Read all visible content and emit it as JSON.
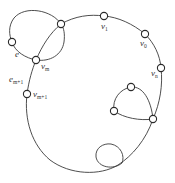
{
  "diagram": {
    "type": "graph",
    "colors": {
      "stroke": "#3a3a3a",
      "node_fill": "#ffffff",
      "background": "#ffffff"
    },
    "labels": {
      "e": {
        "base": "e",
        "sub": ""
      },
      "vm": {
        "base": "v",
        "sub": "m"
      },
      "em1": {
        "base": "e",
        "sub": "m+1"
      },
      "vm1": {
        "base": "v",
        "sub": "m+1"
      },
      "v1": {
        "base": "v",
        "sub": "1"
      },
      "v0": {
        "base": "v",
        "sub": "0"
      },
      "vn": {
        "base": "v",
        "sub": "n"
      }
    },
    "nodes": [
      {
        "id": "top-left",
        "x": 61,
        "y": 24,
        "label": ""
      },
      {
        "id": "left",
        "x": 12,
        "y": 42,
        "label": ""
      },
      {
        "id": "vm",
        "x": 36,
        "y": 60,
        "label": "v_m"
      },
      {
        "id": "vm1",
        "x": 27,
        "y": 94,
        "label": "v_{m+1}"
      },
      {
        "id": "v1",
        "x": 104,
        "y": 16,
        "label": "v_1"
      },
      {
        "id": "v0",
        "x": 145,
        "y": 34,
        "label": "v_0"
      },
      {
        "id": "vn",
        "x": 161,
        "y": 68,
        "label": "v_n"
      },
      {
        "id": "inner-top",
        "x": 131,
        "y": 87,
        "label": ""
      },
      {
        "id": "inner-left",
        "x": 114,
        "y": 111,
        "label": ""
      },
      {
        "id": "inner-right",
        "x": 153,
        "y": 119,
        "label": ""
      }
    ]
  }
}
